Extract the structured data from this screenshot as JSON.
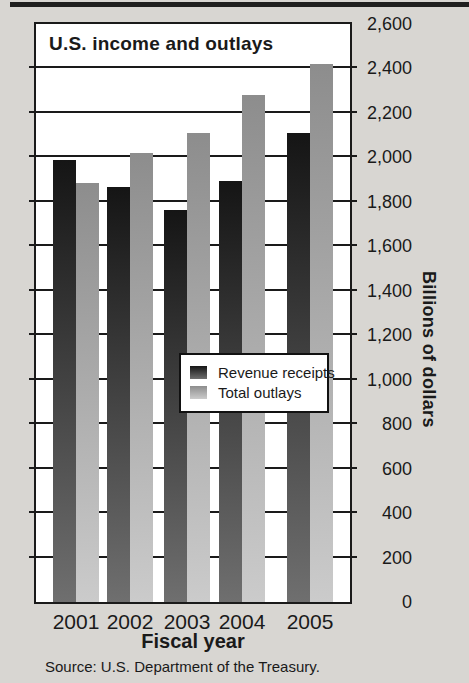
{
  "figure": {
    "title": "U.S. income and outlays",
    "x_axis_title": "Fiscal year",
    "y_axis_title": "Billions of dollars",
    "source": "Source: U.S. Department of the Treasury."
  },
  "legend": {
    "items": [
      {
        "label": "Revenue receipts",
        "series": "receipts"
      },
      {
        "label": "Total outlays",
        "series": "outlays"
      }
    ]
  },
  "chart_data": {
    "type": "bar",
    "categories": [
      "2001",
      "2002",
      "2003",
      "2004",
      "2005"
    ],
    "series": [
      {
        "name": "Revenue receipts",
        "values": [
          1990,
          1865,
          1765,
          1895,
          2110
        ]
      },
      {
        "name": "Total outlays",
        "values": [
          1885,
          2020,
          2110,
          2280,
          2420
        ]
      }
    ],
    "title": "U.S. income and outlays",
    "xlabel": "Fiscal year",
    "ylabel": "Billions of dollars",
    "ylim": [
      0,
      2600
    ],
    "ytick_step": 200,
    "grid": true,
    "legend_position": "inside-center"
  },
  "colors": {
    "background": "#d8d6d2",
    "plot_background": "#ffffff",
    "line": "#1a1a1a",
    "receipts_gradient_top": "#151515",
    "receipts_gradient_bottom": "#6f6f6f",
    "outlays_gradient_top": "#8d8d8d",
    "outlays_gradient_bottom": "#cbcbcb"
  }
}
